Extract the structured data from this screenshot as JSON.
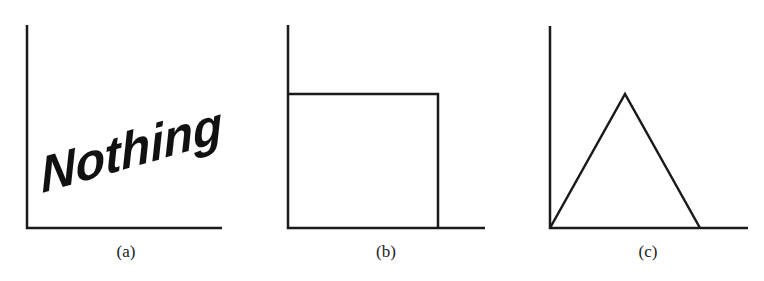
{
  "panels": [
    {
      "id": "a",
      "caption": "(a)",
      "content_text": "Nothing",
      "shape": "none"
    },
    {
      "id": "b",
      "caption": "(b)",
      "shape": "rectangle"
    },
    {
      "id": "c",
      "caption": "(c)",
      "shape": "triangle"
    }
  ],
  "colors": {
    "line": "#1a1a1a",
    "background": "#ffffff"
  }
}
